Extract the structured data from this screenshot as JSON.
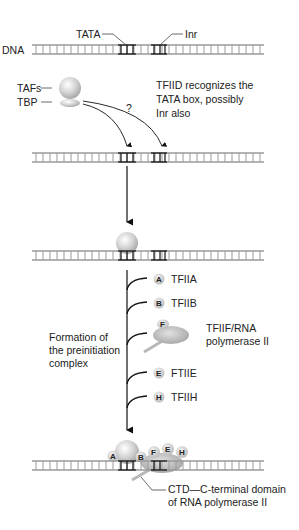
{
  "diagram": {
    "dna_label": "DNA",
    "tata_label": "TATA",
    "inr_label": "Inr",
    "tafs_label": "TAFs",
    "tbp_label": "TBP",
    "question_mark": "?",
    "tfiid_note": [
      "TFIID recognizes the",
      "TATA box, possibly",
      "Inr also"
    ],
    "formation_label": [
      "Formation of",
      "the preinitiation",
      "complex"
    ],
    "factors": [
      {
        "letter": "A",
        "label": "TFIIA"
      },
      {
        "letter": "B",
        "label": "TFIIB"
      },
      {
        "letter": "F",
        "label_lines": [
          "TFIIF/RNA",
          "polymerase II"
        ]
      },
      {
        "letter": "E",
        "label": "FTIIE"
      },
      {
        "letter": "H",
        "label": "TFIIH"
      }
    ],
    "complex_letters": [
      "A",
      "B",
      "F",
      "E",
      "H"
    ],
    "ctd_label": [
      "CTD—C-terminal domain",
      "of RNA polymerase II"
    ],
    "colors": {
      "dna_rail": "#9a9a9a",
      "dna_highlight": "#111111",
      "protein": "#c8c8c8",
      "arrow": "#111111"
    }
  }
}
